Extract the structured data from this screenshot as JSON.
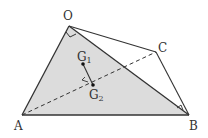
{
  "diagram": {
    "type": "geometry",
    "points": {
      "O": {
        "label": "O",
        "x": 69,
        "y": 26
      },
      "A": {
        "label": "A",
        "x": 22,
        "y": 115
      },
      "B": {
        "label": "B",
        "x": 189,
        "y": 115
      },
      "C": {
        "label": "C",
        "x": 156,
        "y": 52
      },
      "G1": {
        "label": "G",
        "sub": "1",
        "x": 83,
        "y": 64
      },
      "G2": {
        "label": "G",
        "sub": "2",
        "x": 93,
        "y": 85
      }
    },
    "colors": {
      "shade": "#dcdcdc",
      "line": "#333333"
    }
  }
}
